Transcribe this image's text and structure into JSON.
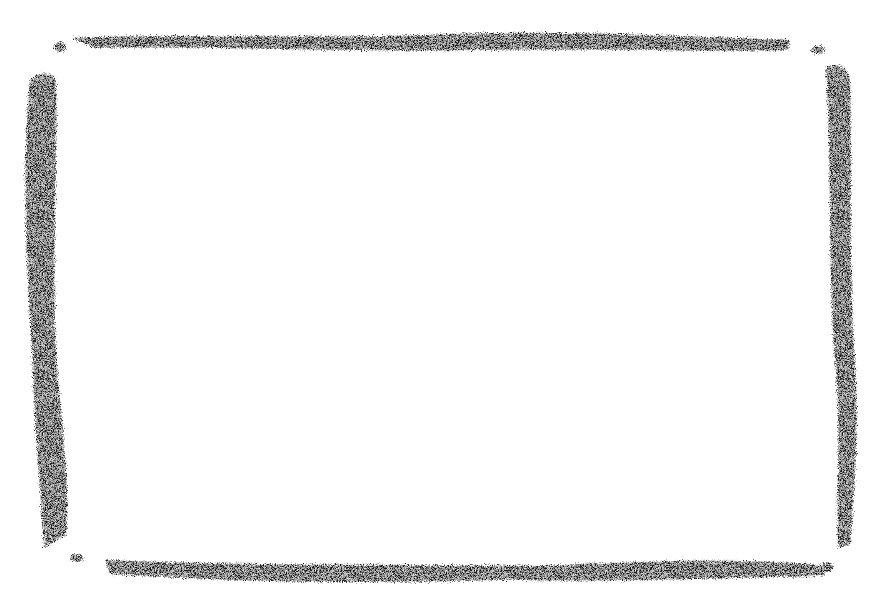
{
  "image": {
    "description": "Hand-drawn crayon rectangular frame on white background",
    "background_color": "#ffffff",
    "stroke_color": "#1a1a1a",
    "interior_text": ""
  },
  "frame": {
    "edges": [
      {
        "name": "top",
        "from": [
          75,
          38
        ],
        "to": [
          790,
          45
        ]
      },
      {
        "name": "right",
        "from": [
          835,
          70
        ],
        "to": [
          845,
          545
        ]
      },
      {
        "name": "bottom",
        "from": [
          105,
          565
        ],
        "to": [
          825,
          575
        ]
      },
      {
        "name": "left",
        "from": [
          40,
          75
        ],
        "to": [
          45,
          545
        ]
      }
    ],
    "corner_specks": [
      {
        "x": 60,
        "y": 46
      },
      {
        "x": 818,
        "y": 50
      },
      {
        "x": 75,
        "y": 558
      },
      {
        "x": 828,
        "y": 566
      }
    ]
  }
}
